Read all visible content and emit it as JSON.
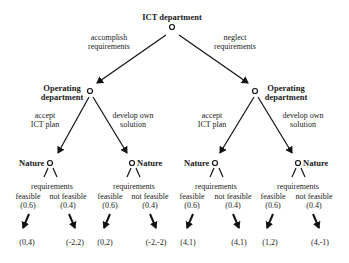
{
  "root": {
    "label": "ICT department"
  },
  "root_branches": {
    "left": [
      "accomplish",
      "requirements"
    ],
    "right": [
      "neglect",
      "requirements"
    ]
  },
  "level1": {
    "left": {
      "label": [
        "Operating",
        "department"
      ]
    },
    "right": {
      "label": [
        "Operating",
        "department"
      ]
    }
  },
  "level1_branches": {
    "accept": [
      "accept",
      "ICT plan"
    ],
    "develop": [
      "develop own",
      "solution"
    ]
  },
  "nature": {
    "label": "Nature",
    "branch_title": "requirements",
    "feasible": "feasible",
    "not_feasible": "not feasible",
    "p_feasible": "(0.6)",
    "p_not_feasible": "(0.4)"
  },
  "payoffs": [
    "(0,4)",
    "(-2,2)",
    "(0,2)",
    "(-2,-2)",
    "(4,1)",
    "(4,1)",
    "(1,2)",
    "(4,-1)"
  ]
}
